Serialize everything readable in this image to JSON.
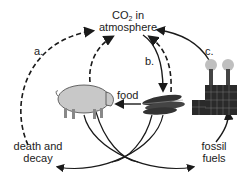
{
  "diagram": {
    "nodes": {
      "atmosphere": {
        "line1_prefix": "CO",
        "line1_sub": "2",
        "line1_suffix": " in",
        "line2": "atmosphere"
      },
      "death_decay": {
        "line1": "death and",
        "line2": "decay"
      },
      "fossil_fuels": {
        "line1": "fossil",
        "line2": "fuels"
      },
      "food_label": "food"
    },
    "arrow_labels": {
      "a": "a.",
      "b": "b.",
      "c": "c."
    },
    "images": [
      "pig-icon",
      "corn-icon",
      "factory-icon"
    ],
    "colors": {
      "stroke": "#1a1a1a",
      "pig": "#c8c8c8",
      "smoke": "#bfbfbf",
      "factory": "#2a2a2a"
    }
  }
}
